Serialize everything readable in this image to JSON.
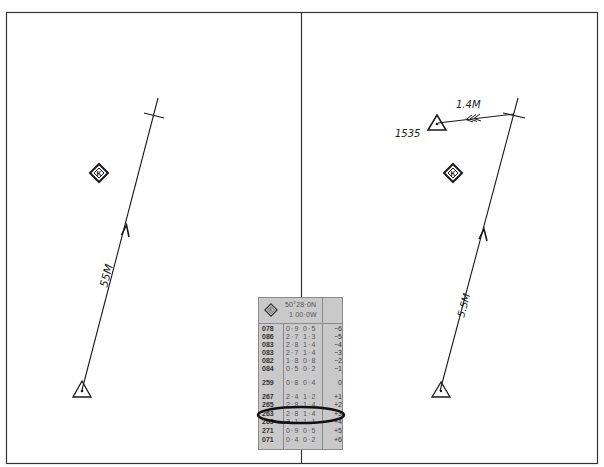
{
  "figure": {
    "panels": [
      {
        "id": "left",
        "course_line_label": "55M",
        "symbols": [
          "tidal-diamond-K",
          "fix-triangle",
          "course-arrow",
          "tick-mark"
        ]
      },
      {
        "id": "right",
        "course_line_label": "5.5M",
        "tide_vector_label": "1.4M",
        "time_label": "1535",
        "symbols": [
          "tidal-diamond-K",
          "fix-triangle",
          "course-arrow",
          "tick-mark",
          "tidal-stream-arrow"
        ]
      }
    ]
  },
  "tidal_table": {
    "symbol": "K",
    "position_lat": "50°28·0N",
    "position_lon": "1 00·0W",
    "rows": [
      {
        "dir": "078",
        "springs": "0·9",
        "neaps": "0·5",
        "hw": "−6"
      },
      {
        "dir": "086",
        "springs": "2·7",
        "neaps": "1·3",
        "hw": "−5"
      },
      {
        "dir": "083",
        "springs": "2·8",
        "neaps": "1·4",
        "hw": "−4"
      },
      {
        "dir": "083",
        "springs": "2·7",
        "neaps": "1·4",
        "hw": "−3"
      },
      {
        "dir": "082",
        "springs": "1·8",
        "neaps": "0·8",
        "hw": "−2"
      },
      {
        "dir": "084",
        "springs": "0·5",
        "neaps": "0·2",
        "hw": "−1"
      },
      {
        "dir": "259",
        "springs": "0·8",
        "neaps": "0·4",
        "hw": "0"
      },
      {
        "dir": "267",
        "springs": "2·4",
        "neaps": "1·2",
        "hw": "+1"
      },
      {
        "dir": "265",
        "springs": "2·8",
        "neaps": "1·4",
        "hw": "+2"
      },
      {
        "dir": "263",
        "springs": "2·8",
        "neaps": "1·4",
        "hw": "+3"
      },
      {
        "dir": "265",
        "springs": "2·1",
        "neaps": "1·1",
        "hw": "+4"
      },
      {
        "dir": "271",
        "springs": "0·9",
        "neaps": "0·5",
        "hw": "+5"
      },
      {
        "dir": "071",
        "springs": "0·4",
        "neaps": "0·2",
        "hw": "+6"
      }
    ],
    "highlighted_row_index": 9
  },
  "colors": {
    "ink": "#1a1a1a",
    "table_fill": "#c9c9c9",
    "table_border": "#8a8a8a",
    "paper": "#ffffff"
  }
}
